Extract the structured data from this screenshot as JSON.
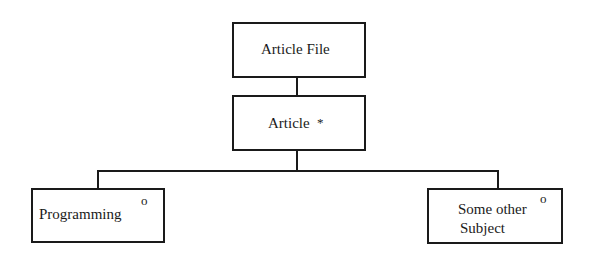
{
  "diagram": {
    "type": "hierarchy",
    "nodes": [
      {
        "id": "article-file",
        "label": "Article File",
        "marker": ""
      },
      {
        "id": "article",
        "label": "Article",
        "marker": "*"
      },
      {
        "id": "programming",
        "label": "Programming",
        "marker": "o"
      },
      {
        "id": "some-other-subject",
        "label_line1": "Some other",
        "label_line2": "Subject",
        "marker": "o"
      }
    ],
    "edges": [
      {
        "from": "article-file",
        "to": "article"
      },
      {
        "from": "article",
        "to": "programming"
      },
      {
        "from": "article",
        "to": "some-other-subject"
      }
    ]
  }
}
